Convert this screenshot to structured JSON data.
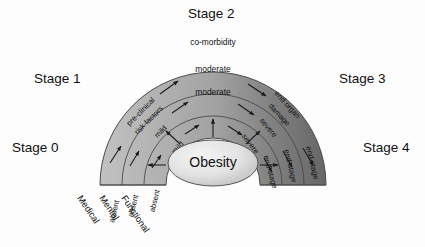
{
  "diagram": {
    "center": {
      "label": "Obesity"
    },
    "stages": [
      {
        "id": "stage0",
        "label": "Stage 0"
      },
      {
        "id": "stage1",
        "label": "Stage 1"
      },
      {
        "id": "stage2",
        "label": "Stage 2"
      },
      {
        "id": "stage3",
        "label": "Stage 3"
      },
      {
        "id": "stage4",
        "label": "Stage 4"
      }
    ],
    "axes": [
      {
        "id": "medical",
        "label": "Medical"
      },
      {
        "id": "mental",
        "label": "Mental"
      },
      {
        "id": "functional",
        "label": "Functional"
      }
    ],
    "rings": [
      {
        "id": "medical-ring",
        "axis": "Medical",
        "cells": [
          {
            "stage": "Stage 0",
            "text": "absent"
          },
          {
            "stage": "Stage 1",
            "text": "pre-clinical"
          },
          {
            "stage": "Stage 1b",
            "text": "risk factors"
          },
          {
            "stage": "Stage 2",
            "text": "co-morbidity"
          },
          {
            "stage": "Stage 3",
            "text": "end organ"
          },
          {
            "stage": "Stage 3b",
            "text": "damage"
          },
          {
            "stage": "Stage 4",
            "text": "end-stage"
          }
        ]
      },
      {
        "id": "mental-ring",
        "axis": "Mental",
        "cells": [
          {
            "stage": "Stage 0",
            "text": "absent"
          },
          {
            "stage": "Stage 1",
            "text": "mild"
          },
          {
            "stage": "Stage 2",
            "text": "moderate"
          },
          {
            "stage": "Stage 3",
            "text": "severe"
          },
          {
            "stage": "Stage 4",
            "text": "end-stage"
          }
        ]
      },
      {
        "id": "functional-ring",
        "axis": "Functional",
        "cells": [
          {
            "stage": "Stage 0",
            "text": "absent"
          },
          {
            "stage": "Stage 1",
            "text": "mild"
          },
          {
            "stage": "Stage 2",
            "text": "moderate"
          },
          {
            "stage": "Stage 3",
            "text": "severe"
          },
          {
            "stage": "Stage 4",
            "text": "end-stage"
          }
        ]
      }
    ],
    "colors": {
      "arc_light": "#b8b8b8",
      "arc_dark": "#6e6e6e",
      "band_stroke": "#4a4a4a",
      "center_fill_light": "#efefef",
      "center_fill_dark": "#c2c2c2",
      "text": "#111111",
      "background": "#fdfdfd"
    }
  }
}
